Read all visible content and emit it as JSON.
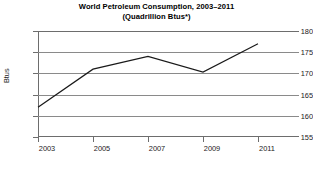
{
  "chart_data": {
    "type": "line",
    "title": "World Petroleum Consumption, 2003–2011",
    "subtitle": "(Quadrillion Btus*)",
    "xlabel": "",
    "ylabel": "Btus",
    "categories": [
      "2003",
      "2005",
      "2007",
      "2009",
      "2011"
    ],
    "x": [
      2003,
      2005,
      2007,
      2009,
      2011
    ],
    "values": [
      162,
      171,
      174,
      170.3,
      177
    ],
    "series": [
      {
        "name": "World Petroleum Consumption",
        "values": [
          162,
          171,
          174,
          170.3,
          177
        ]
      }
    ],
    "ylim": [
      155,
      180
    ],
    "ytick_labels": [
      "155",
      "160",
      "165",
      "170",
      "175",
      "180"
    ],
    "ytick_values": [
      155,
      160,
      165,
      170,
      175,
      180
    ],
    "xtick_labels": [
      "2003",
      "2005",
      "2007",
      "2009",
      "2011"
    ],
    "grid": "horizontal",
    "legend": "none",
    "line_color": "#1a1a1a",
    "grid_color": "#8a8a8a",
    "axis_color": "#6d6d6d",
    "background_color": "#ffffff"
  }
}
